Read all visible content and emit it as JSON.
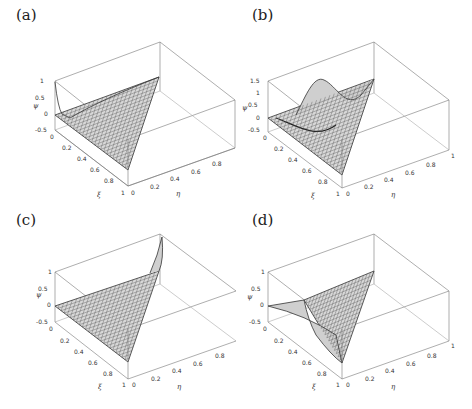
{
  "figure": {
    "panels": [
      {
        "id": "a",
        "label": "(a)",
        "zlabel": "ψ",
        "xlabel": "ξ",
        "ylabel": "η",
        "zticks": [
          "1",
          "0.5",
          "0",
          "-0.5"
        ],
        "xticks": [
          "0",
          "0.2",
          "0.4",
          "0.6",
          "0.8",
          "1"
        ],
        "yticks": [
          "0",
          "0.2",
          "0.4",
          "0.6",
          "0.8",
          "1"
        ],
        "description": "Surface over triangle with peak value 1 at corner (ξ=0, η=0), near-zero elsewhere"
      },
      {
        "id": "b",
        "label": "(b)",
        "zlabel": "ψ",
        "xlabel": "ξ",
        "ylabel": "η",
        "zticks": [
          "1.5",
          "1",
          "0.5",
          "0",
          "-0.5"
        ],
        "xticks": [
          "0",
          "0.2",
          "0.4",
          "0.6",
          "0.8",
          "1"
        ],
        "yticks": [
          "0",
          "0.2",
          "0.4",
          "0.6",
          "0.8",
          "1"
        ],
        "description": "Surface over triangle with interior bump reaching ~1.5"
      },
      {
        "id": "c",
        "label": "(c)",
        "zlabel": "ψ",
        "xlabel": "ξ",
        "ylabel": "η",
        "zticks": [
          "1",
          "0.5",
          "0",
          "-0.5"
        ],
        "xticks": [
          "0",
          "0.2",
          "0.4",
          "0.6",
          "0.8",
          "1"
        ],
        "yticks": [
          "0",
          "0.2",
          "0.4",
          "0.6",
          "0.8",
          "1"
        ],
        "description": "Surface over triangle with peak value 1 at corner (ξ=0, η=1)"
      },
      {
        "id": "d",
        "label": "(d)",
        "zlabel": "ψ",
        "xlabel": "ξ",
        "ylabel": "η",
        "zticks": [
          "1",
          "0.5",
          "0",
          "-0.5"
        ],
        "xticks": [
          "0",
          "0.2",
          "0.4",
          "0.6",
          "0.8",
          "1"
        ],
        "yticks": [
          "0",
          "0.2",
          "0.4",
          "0.6",
          "0.8",
          "1"
        ],
        "description": "Surface over triangle with ridge along edge η=0, dipping negative"
      }
    ]
  }
}
